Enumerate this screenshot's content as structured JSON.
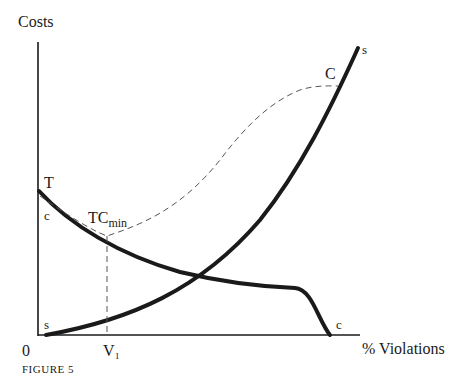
{
  "figure": {
    "caption": "FIGURE 5",
    "y_axis_label": "Costs",
    "x_axis_label": "% Violations",
    "origin_label": "0",
    "x_tick_label": "V₁"
  },
  "curves": {
    "s_curve": {
      "start_label": "s",
      "end_label": "s",
      "style": "thick solid",
      "color": "#1a1a1a"
    },
    "c_curve": {
      "start_label": "c",
      "end_label": "c",
      "style": "thick solid",
      "color": "#1a1a1a"
    },
    "total_cost_curve": {
      "start_label": "T",
      "end_label": "C",
      "style": "dashed",
      "color": "#555555"
    }
  },
  "annotations": {
    "tc_min_main": "TC",
    "tc_min_sub": "min"
  }
}
